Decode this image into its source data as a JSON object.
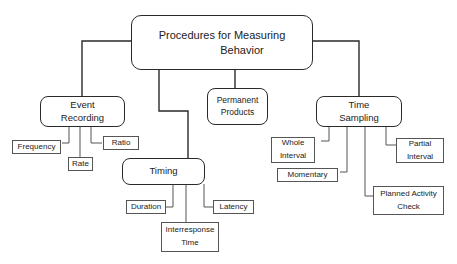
{
  "diagram": {
    "title": "Procedures for Measuring Behavior",
    "root": {
      "line1": "Procedures for Measuring",
      "line2": "Behavior"
    },
    "categories": [
      {
        "id": "event-recording",
        "line1": "Event",
        "line2": "Recording",
        "children": [
          "Frequency",
          "Rate",
          "Ratio"
        ]
      },
      {
        "id": "timing",
        "line1": "Timing",
        "children": [
          "Duration",
          "Interresponse Time",
          "Latency"
        ]
      },
      {
        "id": "permanent-products",
        "line1": "Permanent",
        "line2": "Products",
        "children": []
      },
      {
        "id": "time-sampling",
        "line1": "Time",
        "line2": "Sampling",
        "children": [
          "Whole Interval",
          "Momentary",
          "Planned Activity Check",
          "Partial Interval"
        ]
      }
    ],
    "leaves": {
      "frequency": "Frequency",
      "rate": "Rate",
      "ratio": "Ratio",
      "duration": "Duration",
      "interresponse_line1": "Interresponse",
      "interresponse_line2": "Time",
      "latency": "Latency",
      "whole_line1": "Whole",
      "whole_line2": "Interval",
      "momentary": "Momentary",
      "planned_line1": "Planned Activity",
      "planned_line2": "Check",
      "partial_line1": "Partial",
      "partial_line2": "Interval"
    },
    "colors": {
      "line": "#2a2a2a",
      "leaf_border": "#555555",
      "background": "#ffffff"
    }
  }
}
